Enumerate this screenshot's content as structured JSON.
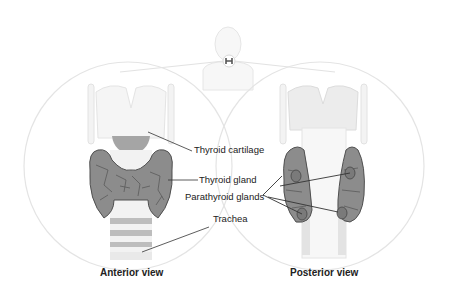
{
  "diagram": {
    "colors": {
      "gland": "#8a8a8a",
      "gland_outline": "#555555",
      "cartilage": "#efefef",
      "outline": "#e2e2e2",
      "label_text": "#222222",
      "leader_line": "#333333"
    },
    "labels": {
      "thyroid_cartilage": "Thyroid cartilage",
      "thyroid_gland": "Thyroid gland",
      "parathyroid_glands": "Parathyroid glands",
      "trachea": "Trachea"
    },
    "views": [
      {
        "id": "anterior",
        "caption": "Anterior view"
      },
      {
        "id": "posterior",
        "caption": "Posterior view"
      }
    ],
    "locator": {
      "icon": "thyroid-icon"
    }
  }
}
